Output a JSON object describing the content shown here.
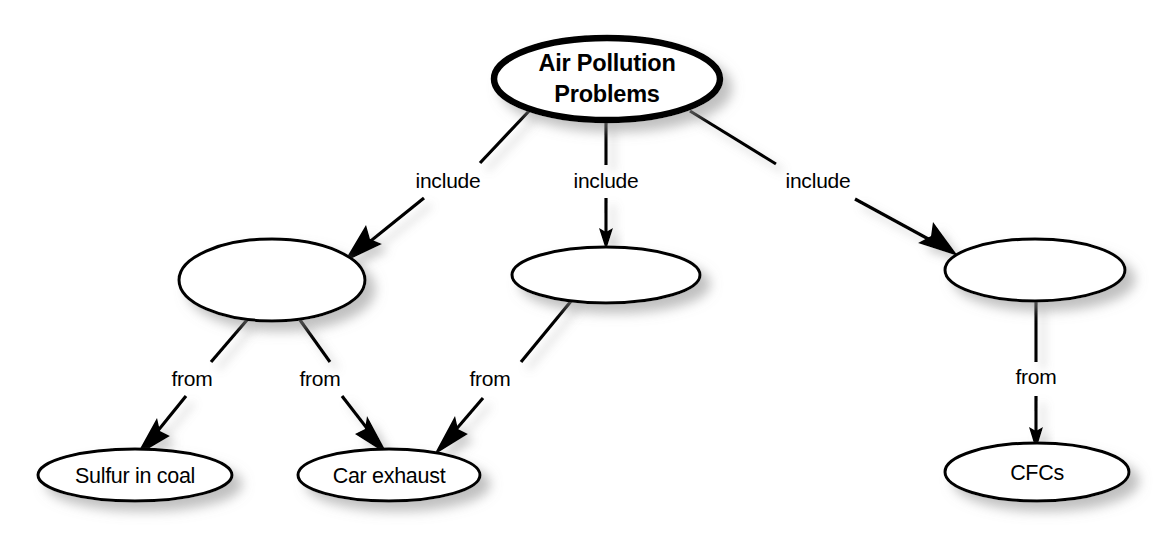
{
  "diagram": {
    "background_color": "#ffffff",
    "stroke_color": "#000000",
    "shadow_color": "#b3b3b3",
    "nodes": [
      {
        "id": "root",
        "label_line1": "Air Pollution",
        "label_line2": "Problems",
        "shape": "ellipse",
        "cx": 607,
        "cy": 79,
        "rx": 113,
        "ry": 41,
        "emphasis": "bold"
      },
      {
        "id": "mid-left",
        "label": "",
        "shape": "ellipse",
        "cx": 272,
        "cy": 280,
        "rx": 93,
        "ry": 41,
        "emphasis": "normal"
      },
      {
        "id": "mid-center",
        "label": "",
        "shape": "ellipse",
        "cx": 606,
        "cy": 275,
        "rx": 94,
        "ry": 28,
        "emphasis": "normal"
      },
      {
        "id": "mid-right",
        "label": "",
        "shape": "ellipse",
        "cx": 1035,
        "cy": 270,
        "rx": 90,
        "ry": 31,
        "emphasis": "normal"
      },
      {
        "id": "sulfur-in-coal",
        "label": "Sulfur in coal",
        "shape": "ellipse",
        "cx": 135,
        "cy": 475,
        "rx": 97,
        "ry": 26,
        "emphasis": "normal"
      },
      {
        "id": "car-exhaust",
        "label": "Car exhaust",
        "shape": "ellipse",
        "cx": 389,
        "cy": 475,
        "rx": 91,
        "ry": 26,
        "emphasis": "normal"
      },
      {
        "id": "cfcs",
        "label": "CFCs",
        "shape": "ellipse",
        "cx": 1037,
        "cy": 472,
        "rx": 92,
        "ry": 29,
        "emphasis": "normal"
      }
    ],
    "edges": [
      {
        "id": "e1",
        "from": "root",
        "to": "mid-left",
        "label": "include"
      },
      {
        "id": "e2",
        "from": "root",
        "to": "mid-center",
        "label": "include"
      },
      {
        "id": "e3",
        "from": "root",
        "to": "mid-right",
        "label": "include"
      },
      {
        "id": "e4",
        "from": "mid-left",
        "to": "sulfur-in-coal",
        "label": "from"
      },
      {
        "id": "e5",
        "from": "mid-left",
        "to": "car-exhaust",
        "label": "from"
      },
      {
        "id": "e6",
        "from": "mid-center",
        "to": "car-exhaust",
        "label": "from"
      },
      {
        "id": "e7",
        "from": "mid-right",
        "to": "cfcs",
        "label": "from"
      }
    ],
    "edge_labels": [
      {
        "id": "l1",
        "text": "include",
        "x": 448,
        "y": 182
      },
      {
        "id": "l2",
        "text": "include",
        "x": 606,
        "y": 182
      },
      {
        "id": "l3",
        "text": "include",
        "x": 818,
        "y": 182
      },
      {
        "id": "l4",
        "text": "from",
        "x": 192,
        "y": 380
      },
      {
        "id": "l5",
        "text": "from",
        "x": 320,
        "y": 380
      },
      {
        "id": "l6",
        "text": "from",
        "x": 490,
        "y": 380
      },
      {
        "id": "l7",
        "text": "from",
        "x": 1036,
        "y": 378
      }
    ]
  }
}
